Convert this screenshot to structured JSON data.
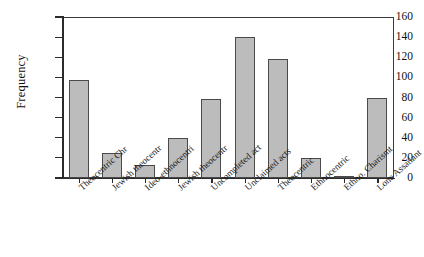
{
  "chart_data": {
    "type": "bar",
    "title": "",
    "xlabel": "",
    "ylabel": "Frequency",
    "ylim": [
      0,
      160
    ],
    "yticks": [
      0,
      20,
      40,
      60,
      80,
      100,
      120,
      140,
      160
    ],
    "grid": false,
    "legend": "none",
    "categories": [
      "Theocentric Chr",
      "Jewish theocentr",
      "Ideo-ethnocentri",
      "Jewish theocentr",
      "Uncompleted act",
      "Unclaimed acts",
      "Theocentric",
      "Ethnocentric",
      "Ethno. Charismt",
      "Lone Assailant"
    ],
    "values": [
      97,
      25,
      13,
      40,
      79,
      140,
      118,
      20,
      2,
      80
    ],
    "series": [
      {
        "name": "Frequency",
        "values": [
          97,
          25,
          13,
          40,
          79,
          140,
          118,
          20,
          2,
          80
        ]
      }
    ],
    "bar_fill_color": "#bcbcbc",
    "bar_edge_color": "#4a4a4a",
    "axis_color": "#2b2b2b",
    "background_color": "#ffffff"
  },
  "figure": {
    "cropped_title_fragment": ""
  }
}
